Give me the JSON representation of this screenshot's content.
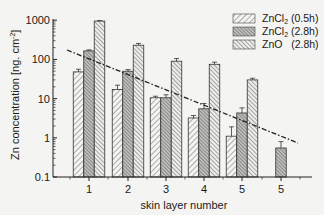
{
  "chart_data": {
    "type": "bar",
    "title": "",
    "xlabel": "skin layer number",
    "ylabel": "Zn concentration [ng. cm-2]",
    "yscale": "log",
    "ylim": [
      0.1,
      1000
    ],
    "yticks": [
      "1000",
      "100",
      "10",
      "1",
      "0.1"
    ],
    "categories": [
      "1",
      "2",
      "3",
      "4",
      "5",
      "5"
    ],
    "series": [
      {
        "name": "ZnCl2 (0.5h)",
        "pattern": "light-forward-hatch",
        "values": [
          48,
          17,
          10.5,
          3.2,
          1.1,
          null
        ],
        "errors": [
          8,
          5,
          1,
          0.5,
          0.8,
          null
        ]
      },
      {
        "name": "ZnCl2 (2.8h)",
        "pattern": "dense-crosshatch",
        "values": [
          165,
          50,
          10.5,
          5.5,
          4.3,
          0.55
        ],
        "errors": [
          10,
          5,
          2,
          2,
          1.5,
          0.25
        ]
      },
      {
        "name": "ZnO (2.8h)",
        "pattern": "back-hatch",
        "values": [
          950,
          230,
          90,
          75,
          30,
          null
        ],
        "errors": [
          30,
          25,
          15,
          10,
          3,
          null
        ]
      }
    ],
    "trendline": {
      "style": "dash-dot",
      "from": {
        "x": "1 (left)",
        "y": 200
      },
      "to": {
        "x": "5 (right)",
        "y": 0.6
      }
    },
    "legend_position": "upper-right",
    "grid": false
  },
  "legend": {
    "items": [
      {
        "label": "ZnCl",
        "sub": "2",
        "suffix": " (0.5h)"
      },
      {
        "label": "ZnCl",
        "sub": "2",
        "suffix": " (2.8h)"
      },
      {
        "label": "ZnO",
        "sub": "",
        "suffix": "   (2.8h)"
      }
    ]
  },
  "axes": {
    "y_title": "Zn concentration [ng. cm",
    "y_title_sup": "-2",
    "y_title_end": "]",
    "x_title": "skin layer number",
    "y_ticks": [
      "1000",
      "100",
      "10",
      "1",
      "0.1"
    ],
    "x_ticks": [
      "1",
      "2",
      "3",
      "4",
      "5",
      "5"
    ]
  }
}
